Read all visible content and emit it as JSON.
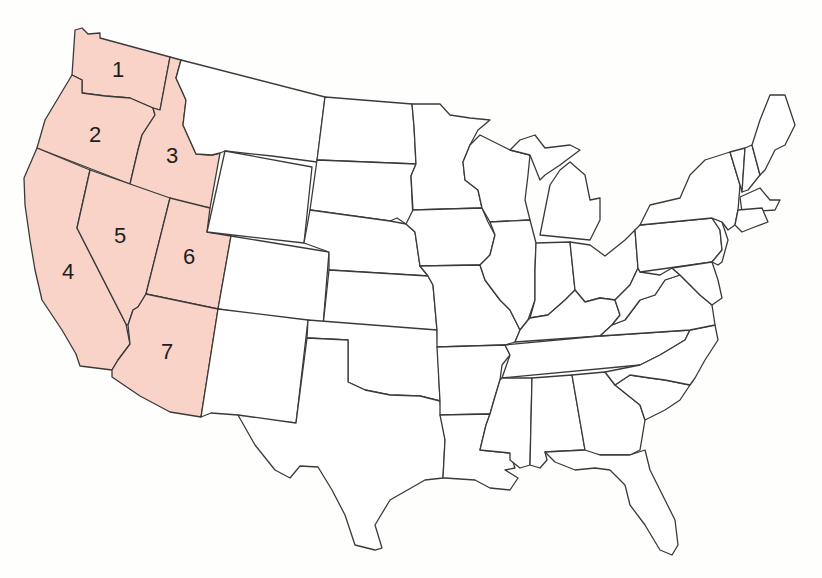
{
  "map": {
    "subject": "Contiguous United States",
    "highlight_color": "#f9d3c8",
    "base_color": "#ffffff",
    "border_color": "#3a3a3a",
    "background": "#fefefc",
    "highlighted_region": "Western states",
    "labels": [
      {
        "number": "1",
        "x": 118,
        "y": 70
      },
      {
        "number": "2",
        "x": 95,
        "y": 135
      },
      {
        "number": "3",
        "x": 172,
        "y": 156
      },
      {
        "number": "4",
        "x": 68,
        "y": 272
      },
      {
        "number": "5",
        "x": 120,
        "y": 236
      },
      {
        "number": "6",
        "x": 189,
        "y": 257
      },
      {
        "number": "7",
        "x": 167,
        "y": 352
      }
    ]
  }
}
